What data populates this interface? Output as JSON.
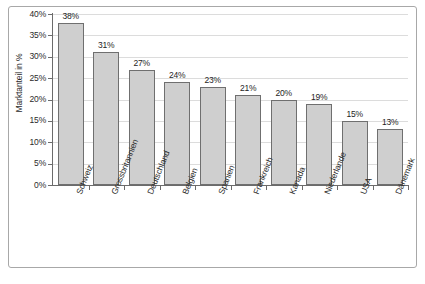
{
  "chart_data": {
    "type": "bar",
    "title": "",
    "subtitle": "",
    "xlabel": "",
    "ylabel": "Marktanteil in %",
    "categories": [
      "Schweiz",
      "Grossbritannien",
      "Deutschland",
      "Belgien",
      "Spanien",
      "Frankreich",
      "Kanada",
      "Niederlande",
      "USA",
      "Dänemark"
    ],
    "values": [
      38,
      31,
      27,
      24,
      23,
      21,
      20,
      19,
      15,
      13
    ],
    "value_labels": [
      "38%",
      "31%",
      "27%",
      "24%",
      "23%",
      "21%",
      "20%",
      "19%",
      "15%",
      "13%"
    ],
    "ylim": [
      0,
      40
    ],
    "ytick_values": [
      0,
      5,
      10,
      15,
      20,
      25,
      30,
      35,
      40
    ],
    "ytick_labels": [
      "0%",
      "5%",
      "10%",
      "15%",
      "20%",
      "25%",
      "30%",
      "35%",
      "40%"
    ],
    "grid": "horizontal",
    "legend": "none",
    "bar_fill_color": "#cfcfcf",
    "bar_border_color": "#6f6f6f",
    "axis_color": "#6b6b6b",
    "gridline_color": "#dcdcdc",
    "frame_color": "#a8a8a8",
    "text_color": "#2b2b2b"
  }
}
